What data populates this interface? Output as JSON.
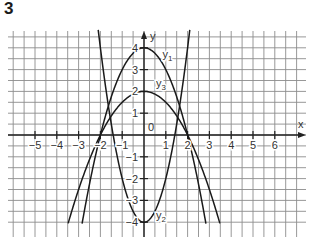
{
  "task_number": "3",
  "chart_data": {
    "type": "line",
    "title": "",
    "xlabel": "x",
    "ylabel": "y",
    "xlim": [
      -6.2,
      7.4
    ],
    "ylim": [
      -4.6,
      4.7
    ],
    "grid": true,
    "grid_step": 0.5,
    "x_ticks": [
      -5,
      -4,
      -3,
      -2,
      -1,
      1,
      2,
      3,
      4,
      5,
      6
    ],
    "x_tick_labels": [
      "−5",
      "−4",
      "−3",
      "−2",
      "−1",
      "1",
      "2",
      "3",
      "4",
      "5",
      "6"
    ],
    "y_ticks": [
      -4,
      -3,
      -2,
      -1,
      1,
      2,
      3,
      4
    ],
    "y_tick_labels": [
      "−4",
      "−3",
      "−2",
      "−1",
      "1",
      "2",
      "3",
      "4"
    ],
    "origin_label": "0",
    "series": [
      {
        "name": "y1",
        "label": "y",
        "sub": "1",
        "formula": "4 - x^2",
        "a": -1,
        "c": 4,
        "label_pos": [
          0.85,
          3.55
        ]
      },
      {
        "name": "y2",
        "label": "y",
        "sub": "2",
        "formula": "2x^2 - 4",
        "a": 2,
        "c": -4,
        "label_pos": [
          0.55,
          -3.85
        ]
      },
      {
        "name": "y3",
        "label": "y",
        "sub": "3",
        "formula": "2 - x^2/2",
        "a": -0.5,
        "c": 2,
        "label_pos": [
          0.55,
          2.2
        ]
      }
    ]
  }
}
